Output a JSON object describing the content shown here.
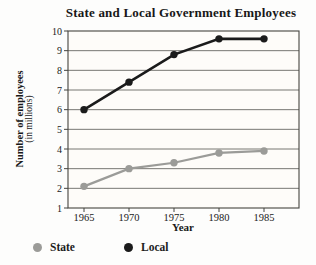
{
  "chart_data": {
    "type": "line",
    "title": "State and Local Government Employees",
    "xlabel": "Year",
    "ylabel_line1": "Number of employees",
    "ylabel_line2": "(in millions)",
    "categories": [
      "1965",
      "1970",
      "1975",
      "1980",
      "1985"
    ],
    "yticks": [
      1,
      2,
      3,
      4,
      5,
      6,
      7,
      8,
      9,
      10
    ],
    "ylim": [
      1,
      10
    ],
    "grid": true,
    "legend_position": "bottom",
    "series": [
      {
        "name": "State",
        "color": "#9b9b98",
        "values": [
          2.1,
          3.0,
          3.3,
          3.8,
          3.9
        ]
      },
      {
        "name": "Local",
        "color": "#1b1b1b",
        "values": [
          6.0,
          7.4,
          8.8,
          9.6,
          9.6
        ]
      }
    ],
    "colors": {
      "plot_background": "#fefcf9",
      "grid_line": "#555550",
      "axis_border": "#45443f",
      "tick_text": "#1a1a1a"
    }
  }
}
